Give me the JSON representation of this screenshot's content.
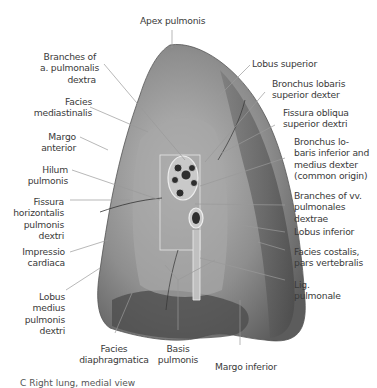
{
  "figure": {
    "title": "Right lung, medial view",
    "caption": "C  Right lung, medial view"
  },
  "labels": {
    "apex_pulmonis": "Apex pulmonis",
    "branches_a_pulmonalis": [
      "Branches of",
      "a. pulmonalis",
      "dextra"
    ],
    "facies_mediastinalis": [
      "Facies",
      "mediastinalis"
    ],
    "margo_anterior": [
      "Margo",
      "anterior"
    ],
    "hilum_pulmonis": [
      "Hilum",
      "pulmonis"
    ],
    "fissura_horizontalis": [
      "Fissura",
      "horizontalis",
      "pulmonis",
      "dextri"
    ],
    "impressio_cardiaca": [
      "Impressio",
      "cardiaca"
    ],
    "lobus_medius": [
      "Lobus",
      "medius",
      "pulmonis",
      "dextri"
    ],
    "facies_diaphragmatica": [
      "Facies",
      "diaphragmatica"
    ],
    "basis_pulmonis": [
      "Basis",
      "pulmonis"
    ],
    "margo_inferior": "Margo inferior",
    "lobus_superior": "Lobus superior",
    "bronchus_lobaris_superior": [
      "Bronchus lobaris",
      "superior dexter"
    ],
    "fissura_obliqua": [
      "Fissura obliqua",
      "superior dextri"
    ],
    "bronchus_lobaris_inferior": [
      "Bronchus lo-",
      "baris inferior and",
      "medius dexter",
      "(common origin)"
    ],
    "branches_vv_pulmonales": [
      "Branches of vv.",
      "pulmonales",
      "dextrae"
    ],
    "lobus_inferior": "Lobus inferior",
    "facies_costalis": [
      "Facies costalis,",
      "pars vertebralis"
    ],
    "lig_pulmonale": [
      "Lig.",
      "pulmonale"
    ]
  },
  "colors": {
    "leader_line": "#9a9a9a",
    "lung_light": "#b4b4b4",
    "lung_dark": "#5a5a5a",
    "text": "#3a3a3a"
  }
}
